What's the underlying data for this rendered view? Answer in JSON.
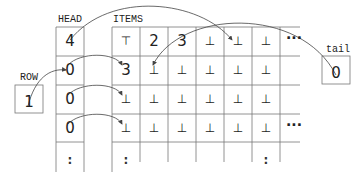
{
  "labels": {
    "head": "HEAD",
    "items": "ITEMS",
    "row": "ROW",
    "tail": "tail"
  },
  "head_column": [
    "4",
    "0",
    "0",
    "0",
    ":"
  ],
  "items_grid": [
    [
      "⊤",
      "2",
      "3",
      "⊥",
      "⊥",
      "⊥"
    ],
    [
      "3",
      "⊥",
      "⊥",
      "⊥",
      "⊥",
      "⊥"
    ],
    [
      "⊥",
      "⊥",
      "⊥",
      "⊥",
      "⊥",
      "⊥"
    ],
    [
      "⊥",
      "⊥",
      "⊥",
      "⊥",
      "⊥",
      "⊥"
    ],
    [
      ":",
      "",
      "",
      "",
      "",
      ":"
    ]
  ],
  "row_box": {
    "value": "1"
  },
  "tail_box": {
    "value": "0"
  },
  "ellipsis": {
    "row0": "...",
    "row3": "..."
  },
  "colors": {
    "line": "#555555",
    "text": "#222222",
    "background": "#ffffff"
  }
}
